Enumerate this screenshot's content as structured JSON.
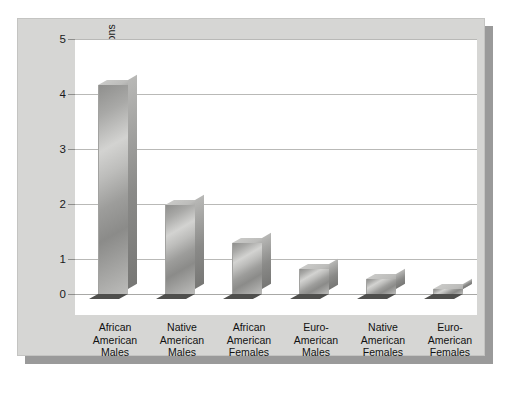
{
  "chart_data": {
    "type": "bar",
    "title": "",
    "subtitle": "",
    "xlabel": "",
    "ylabel": "Number of Homicides Per 100 Persons",
    "ylim": [
      0,
      5
    ],
    "yticks": [
      "0",
      "1",
      "2",
      "3",
      "4",
      "5"
    ],
    "grid": true,
    "legend": "none",
    "orientation": "vertical",
    "style": "3d-bars",
    "categories": [
      "African American Males",
      "Native American Males",
      "African American Females",
      "Euro-American Males",
      "Native American Females",
      "Euro-American Females"
    ],
    "category_lines": [
      [
        "African",
        "American",
        "Males"
      ],
      [
        "Native",
        "American",
        "Males"
      ],
      [
        "African",
        "American",
        "Females"
      ],
      [
        "Euro-",
        "American",
        "Males"
      ],
      [
        "Native",
        "American",
        "Females"
      ],
      [
        "Euro-",
        "American",
        "Females"
      ]
    ],
    "values": [
      4.1,
      1.75,
      1.0,
      0.5,
      0.3,
      0.1
    ],
    "colors": {
      "bar_front_light": "#d3d3d1",
      "bar_front_dark": "#8b8b89",
      "bar_side": "#8a8a88",
      "bar_base": "#4f4f4d",
      "panel_background": "#d6d6d4",
      "plot_background": "#ffffff",
      "gridline": "#b9b9b7",
      "shadow": "#9a9a9a",
      "text": "#1a1a1a"
    }
  }
}
